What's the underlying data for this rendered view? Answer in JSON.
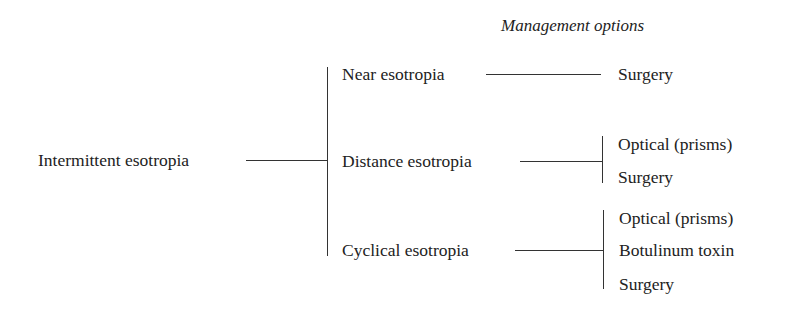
{
  "diagram": {
    "type": "tree",
    "header": "Management options",
    "root": {
      "label": "Intermittent esotropia"
    },
    "branches": [
      {
        "label": "Near esotropia",
        "options": [
          "Surgery"
        ]
      },
      {
        "label": "Distance esotropia",
        "options": [
          "Optical (prisms)",
          "Surgery"
        ]
      },
      {
        "label": "Cyclical esotropia",
        "options": [
          "Optical (prisms)",
          "Botulinum toxin",
          "Surgery"
        ]
      }
    ],
    "colors": {
      "text": "#222222",
      "line": "#333333",
      "background": "#ffffff"
    }
  }
}
